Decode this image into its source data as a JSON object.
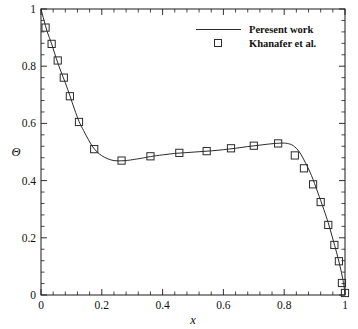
{
  "chart_data": {
    "type": "line",
    "title": "",
    "subtitle": "",
    "xlabel": "x",
    "ylabel": "Θ",
    "xlim": [
      0,
      1
    ],
    "ylim": [
      0,
      1
    ],
    "grid": false,
    "legend_position": "top-right",
    "x_ticks": [
      "0",
      "0.2",
      "0.4",
      "0.6",
      "0.8",
      "1"
    ],
    "x_tick_values": [
      0,
      0.2,
      0.4,
      0.6,
      0.8,
      1
    ],
    "y_ticks": [
      "0",
      "0.2",
      "0.4",
      "0.6",
      "0.8",
      "1"
    ],
    "y_tick_values": [
      0,
      0.2,
      0.4,
      0.6,
      0.8,
      1
    ],
    "x_minor_ticks_per_interval": 4,
    "y_minor_ticks_per_interval": 4,
    "series": [
      {
        "name": "Peresent work",
        "style": "line",
        "marker": "none",
        "color": "#2b2b2b",
        "x": [
          0.0,
          0.01,
          0.02,
          0.035,
          0.05,
          0.065,
          0.08,
          0.095,
          0.11,
          0.125,
          0.14,
          0.155,
          0.17,
          0.185,
          0.2,
          0.22,
          0.24,
          0.26,
          0.28,
          0.3,
          0.33,
          0.36,
          0.4,
          0.44,
          0.48,
          0.52,
          0.56,
          0.6,
          0.64,
          0.68,
          0.72,
          0.76,
          0.79,
          0.81,
          0.83,
          0.85,
          0.87,
          0.89,
          0.91,
          0.93,
          0.945,
          0.96,
          0.972,
          0.982,
          0.99,
          0.995,
          1.0
        ],
        "y": [
          1.0,
          0.96,
          0.922,
          0.878,
          0.828,
          0.783,
          0.742,
          0.697,
          0.65,
          0.607,
          0.575,
          0.545,
          0.518,
          0.5,
          0.487,
          0.476,
          0.47,
          0.469,
          0.47,
          0.473,
          0.478,
          0.484,
          0.49,
          0.495,
          0.498,
          0.501,
          0.504,
          0.508,
          0.513,
          0.519,
          0.524,
          0.529,
          0.531,
          0.53,
          0.522,
          0.5,
          0.462,
          0.417,
          0.36,
          0.3,
          0.252,
          0.196,
          0.15,
          0.108,
          0.07,
          0.043,
          0.005
        ]
      },
      {
        "name": "Khanafer et al.",
        "style": "marker",
        "marker": "open-square",
        "color": "#2b2b2b",
        "x": [
          0.015,
          0.035,
          0.055,
          0.075,
          0.095,
          0.125,
          0.175,
          0.265,
          0.36,
          0.455,
          0.545,
          0.625,
          0.7,
          0.78,
          0.835,
          0.865,
          0.895,
          0.92,
          0.945,
          0.965,
          0.98,
          0.99,
          1.0
        ],
        "y": [
          0.935,
          0.878,
          0.82,
          0.76,
          0.695,
          0.605,
          0.51,
          0.47,
          0.485,
          0.497,
          0.503,
          0.513,
          0.522,
          0.53,
          0.488,
          0.443,
          0.387,
          0.325,
          0.245,
          0.175,
          0.118,
          0.042,
          0.007
        ]
      }
    ],
    "legend": [
      {
        "label": "Peresent work",
        "type": "line"
      },
      {
        "label": "Khanafer et al.",
        "type": "open-square"
      }
    ]
  }
}
